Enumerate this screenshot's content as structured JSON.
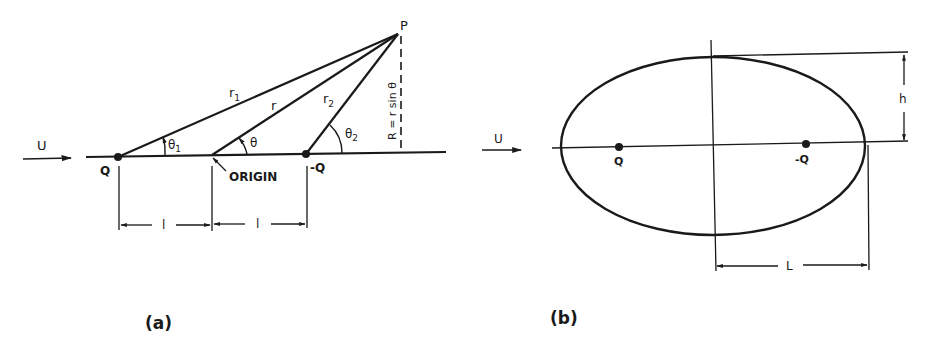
{
  "figure": {
    "panel_a": {
      "caption": "(a)",
      "labels": {
        "freestream": "U",
        "source": "Q",
        "sink": "-Q",
        "origin": "ORIGIN",
        "point": "P",
        "r1": "r",
        "r1_sub": "1",
        "r": "r",
        "r2": "r",
        "r2_sub": "2",
        "theta1": "θ",
        "theta1_sub": "1",
        "theta": "θ",
        "theta2": "θ",
        "theta2_sub": "2",
        "radius_expr": "R = r sin θ",
        "half_spacing_left": "l",
        "half_spacing_right": "l"
      }
    },
    "panel_b": {
      "caption": "(b)",
      "labels": {
        "freestream": "U",
        "source": "Q",
        "sink": "-Q",
        "half_height": "h",
        "half_length": "L"
      }
    }
  }
}
